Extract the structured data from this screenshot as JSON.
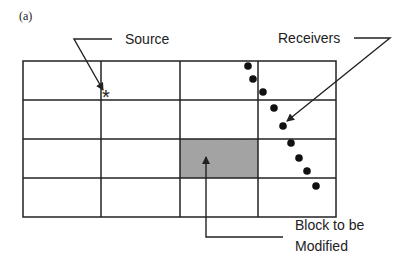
{
  "figure": {
    "panel_label": "(a)",
    "labels": {
      "source": "Source",
      "receivers": "Receivers",
      "block_line1": "Block to be",
      "block_line2": "Modified"
    },
    "grid": {
      "rows": 4,
      "cols": 4,
      "x_lines": [
        23,
        101,
        180,
        258,
        336
      ],
      "y_lines": [
        61,
        100,
        139,
        178,
        217
      ]
    },
    "shaded_block": {
      "row": 2,
      "col": 2,
      "color": "#a8a8a8"
    },
    "source_marker": {
      "symbol": "*",
      "x": 107,
      "y": 93
    },
    "receivers": [
      {
        "x": 248,
        "y": 66
      },
      {
        "x": 253,
        "y": 79
      },
      {
        "x": 263,
        "y": 92
      },
      {
        "x": 274,
        "y": 109
      },
      {
        "x": 283,
        "y": 126
      },
      {
        "x": 292,
        "y": 143
      },
      {
        "x": 299,
        "y": 158
      },
      {
        "x": 307,
        "y": 171
      },
      {
        "x": 316,
        "y": 186
      }
    ],
    "colors": {
      "line": "#222222",
      "shade": "#a8a8a8"
    }
  }
}
